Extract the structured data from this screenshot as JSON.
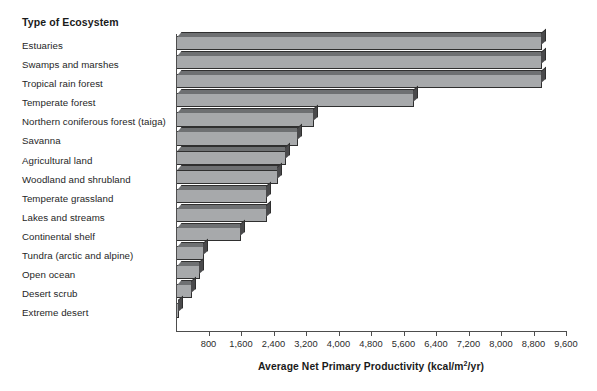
{
  "header": {
    "category_column_title": "Type of Ecosystem"
  },
  "axis": {
    "x_title_main": "Average Net Primary Productivity (kcal/m",
    "x_title_sup": "2",
    "x_title_tail": "/yr)",
    "x_title_full": "Average Net Primary Productivity (kcal/m2/yr)",
    "tick_labels": [
      "800",
      "1,600",
      "2,400",
      "3,200",
      "4,000",
      "4,800",
      "5,600",
      "6,400",
      "7,200",
      "8,000",
      "8,800",
      "9,600"
    ]
  },
  "colors": {
    "bar_face": "#a7a9ab",
    "bar_top": "#6e7072",
    "bar_side": "#4a4a4c",
    "bar_outline": "#2f2f2f",
    "axis": "#4d4d4d",
    "text": "#262626",
    "background": "#ffffff"
  },
  "chart_data": {
    "type": "bar",
    "orientation": "horizontal",
    "title": "",
    "xlabel": "Average Net Primary Productivity (kcal/m2/yr)",
    "ylabel": "Type of Ecosystem",
    "xlim": [
      0,
      9600
    ],
    "xticks": [
      800,
      1600,
      2400,
      3200,
      4000,
      4800,
      5600,
      6400,
      7200,
      8000,
      8800,
      9600
    ],
    "grid": false,
    "legend": "none",
    "units": "kcal/m2/yr",
    "categories": [
      "Estuaries",
      "Swamps and marshes",
      "Tropical rain forest",
      "Temperate forest",
      "Northern coniferous forest (taiga)",
      "Savanna",
      "Agricultural land",
      "Woodland and shrubland",
      "Temperate grassland",
      "Lakes and streams",
      "Continental shelf",
      "Tundra (arctic and alpine)",
      "Open ocean",
      "Desert scrub",
      "Extreme desert"
    ],
    "values": [
      9000,
      9000,
      9000,
      5850,
      3400,
      3000,
      2700,
      2500,
      2250,
      2250,
      1600,
      700,
      600,
      400,
      70
    ]
  }
}
